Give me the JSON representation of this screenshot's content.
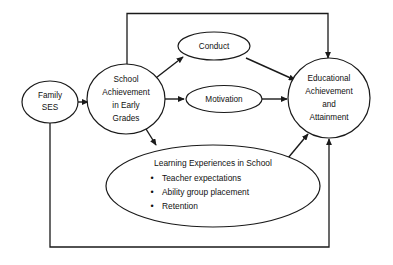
{
  "diagram": {
    "type": "path-model-diagram",
    "background_color": "#ffffff",
    "line_color": "#1a1a1a",
    "text_color": "#111111",
    "nodes": [
      {
        "id": "family-ses",
        "shape": "ellipse",
        "lines": [
          "Family",
          "SES"
        ]
      },
      {
        "id": "school-achievement",
        "shape": "ellipse",
        "lines": [
          "School",
          "Achievement",
          "in Early",
          "Grades"
        ]
      },
      {
        "id": "conduct",
        "shape": "ellipse",
        "lines": [
          "Conduct"
        ]
      },
      {
        "id": "motivation",
        "shape": "ellipse",
        "lines": [
          "Motivation"
        ]
      },
      {
        "id": "educational-achievement",
        "shape": "ellipse",
        "lines": [
          "Educational",
          "Achievement",
          "and",
          "Attainment"
        ]
      },
      {
        "id": "learning-experiences",
        "shape": "ellipse",
        "title": "Learning Experiences in School",
        "bullet_marker": "•",
        "bullets": [
          "Teacher expectations",
          "Ability group placement",
          "Retention"
        ]
      }
    ],
    "edges": [
      {
        "id": "family-ses-to-school-achievement",
        "from": "family-ses",
        "to": "school-achievement",
        "arrow": true
      },
      {
        "id": "school-achievement-to-conduct",
        "from": "school-achievement",
        "to": "conduct",
        "arrow": true
      },
      {
        "id": "school-achievement-to-motivation",
        "from": "school-achievement",
        "to": "motivation",
        "arrow": true
      },
      {
        "id": "school-achievement-to-learning-experiences",
        "from": "school-achievement",
        "to": "learning-experiences",
        "arrow": true
      },
      {
        "id": "conduct-to-educational-achievement",
        "from": "conduct",
        "to": "educational-achievement",
        "arrow": true
      },
      {
        "id": "motivation-to-educational-achievement",
        "from": "motivation",
        "to": "educational-achievement",
        "arrow": true
      },
      {
        "id": "learning-experiences-to-educational-achievement",
        "from": "learning-experiences",
        "to": "educational-achievement",
        "arrow": true
      },
      {
        "id": "school-achievement-to-educational-achievement-top",
        "from": "school-achievement",
        "to": "educational-achievement",
        "arrow": true,
        "route": "top"
      },
      {
        "id": "family-ses-to-educational-achievement-bottom",
        "from": "family-ses",
        "to": "educational-achievement",
        "arrow": true,
        "route": "bottom"
      }
    ]
  }
}
